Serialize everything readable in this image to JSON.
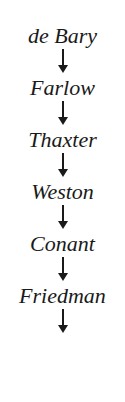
{
  "diagram": {
    "type": "vertical-lineage-chain",
    "orientation": "top-to-bottom",
    "text_color": "#1a1a1a",
    "background_color": "#ffffff",
    "arrow_icon_name": "down-arrow-icon",
    "arrow_glyph": "↓",
    "trailing_arrow": true,
    "nodes": [
      {
        "label": "de Bary"
      },
      {
        "label": "Farlow"
      },
      {
        "label": "Thaxter"
      },
      {
        "label": "Weston"
      },
      {
        "label": "Conant"
      },
      {
        "label": "Friedman"
      }
    ]
  }
}
